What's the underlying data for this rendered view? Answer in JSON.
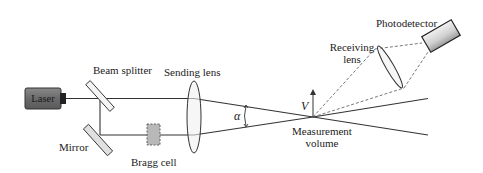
{
  "diagram": {
    "type": "laser-doppler-velocimetry-schematic",
    "labels": {
      "laser": "Laser",
      "beam_splitter": "Beam splitter",
      "mirror": "Mirror",
      "bragg_cell": "Bragg cell",
      "sending_lens": "Sending lens",
      "angle": "α",
      "velocity": "V",
      "measurement_line1": "Measurement",
      "measurement_line2": "volume",
      "receiving_line1": "Receiving",
      "receiving_line2": "lens",
      "photodetector": "Photodetector"
    },
    "colors": {
      "background": "#ffffff",
      "line": "#333333",
      "laser_body": "#6e6e6e",
      "component_fill": "#e6e6e6",
      "bragg_fill": "#b8b8b8"
    }
  }
}
